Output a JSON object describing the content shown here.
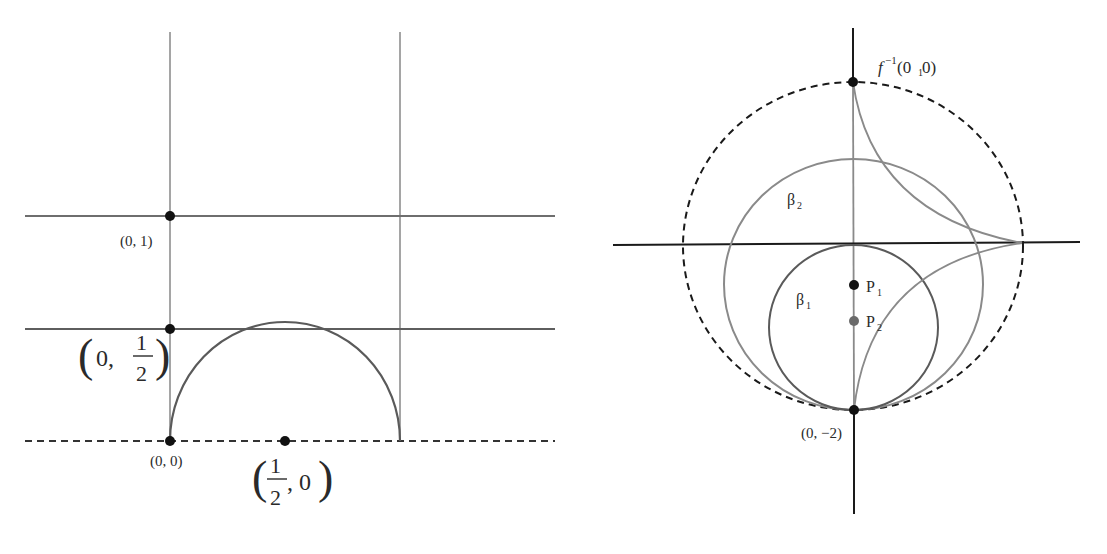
{
  "left_figure": {
    "points": {
      "p01": {
        "label": "(0, 1)"
      },
      "p0half": {
        "label_open": "(",
        "label_zero": "0,",
        "frac_num": "1",
        "frac_den": "2",
        "label_close": ")"
      },
      "p00": {
        "label": "(0, 0)"
      },
      "phalf0": {
        "label_open": "(",
        "frac_num": "1",
        "frac_den": "2",
        "label_rest": ", 0",
        "label_close": ")"
      }
    }
  },
  "right_figure": {
    "labels": {
      "top_point": {
        "f": "f",
        "sup": "−1",
        "args": "(0",
        "sub": "1",
        "args_end": " 0)"
      },
      "bottom_point": "(0, −2)",
      "beta1": {
        "base": "β",
        "sub": "1"
      },
      "beta2": {
        "base": "β",
        "sub": "2"
      },
      "p1": {
        "base": "P",
        "sub": "1"
      },
      "p2": {
        "base": "P",
        "sub": "2"
      }
    }
  },
  "colors": {
    "line_gray": "#8a8a8a",
    "line_dark": "#555555",
    "axis_black": "#1a1a1a",
    "point_black": "#111111",
    "point_gray": "#6a6a6a"
  }
}
